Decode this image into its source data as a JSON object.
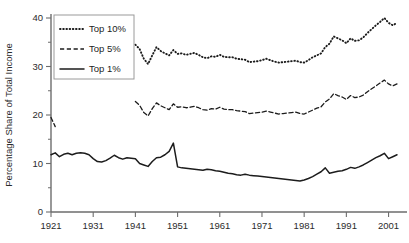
{
  "chart_data": {
    "type": "line",
    "title": "",
    "xlabel": "",
    "ylabel": "Percentage Share of Total Income",
    "xlim": [
      1921,
      2003
    ],
    "ylim": [
      0,
      40
    ],
    "grid": false,
    "legend_position": "top-left",
    "xticks": [
      1921,
      1931,
      1941,
      1951,
      1961,
      1971,
      1981,
      1991,
      2001
    ],
    "xtick_labels": [
      "1921",
      "1931",
      "1941",
      "1951",
      "1961",
      "1971",
      "1981",
      "1991",
      "2001"
    ],
    "yticks": [
      0,
      10,
      20,
      30,
      40
    ],
    "ytick_labels": [
      "0",
      "10",
      "20",
      "30",
      "40"
    ],
    "yticks_minor": [
      5,
      15,
      25,
      35
    ],
    "series": [
      {
        "name": "Top 10%",
        "style": "dotted",
        "color": "#1c1c1c",
        "x": [
          1941,
          1942,
          1943,
          1944,
          1945,
          1946,
          1947,
          1948,
          1949,
          1950,
          1951,
          1952,
          1953,
          1954,
          1955,
          1956,
          1957,
          1958,
          1959,
          1960,
          1961,
          1962,
          1963,
          1964,
          1965,
          1966,
          1967,
          1968,
          1969,
          1970,
          1971,
          1972,
          1973,
          1974,
          1975,
          1976,
          1977,
          1978,
          1979,
          1980,
          1981,
          1982,
          1983,
          1984,
          1985,
          1986,
          1987,
          1988,
          1989,
          1990,
          1991,
          1992,
          1993,
          1994,
          1995,
          1996,
          1997,
          1998,
          1999,
          2000,
          2001,
          2002,
          2003
        ],
        "y": [
          34.5,
          33.6,
          31.6,
          30.5,
          32.3,
          34.0,
          33.2,
          32.7,
          32.3,
          33.4,
          32.6,
          32.7,
          32.4,
          32.6,
          32.8,
          32.4,
          31.9,
          31.7,
          32.1,
          32.0,
          32.4,
          32.0,
          31.9,
          31.9,
          31.6,
          31.5,
          31.4,
          30.9,
          31.0,
          31.1,
          31.3,
          31.6,
          31.3,
          31.0,
          30.8,
          30.9,
          31.0,
          31.1,
          31.2,
          30.9,
          30.8,
          31.3,
          31.9,
          32.3,
          32.7,
          34.0,
          34.7,
          36.2,
          35.8,
          35.4,
          34.8,
          35.8,
          35.3,
          35.4,
          36.0,
          36.9,
          37.7,
          38.5,
          39.2,
          40.0,
          39.0,
          38.5,
          39.0
        ]
      },
      {
        "name": "Top 5%",
        "style": "dashed",
        "color": "#1c1c1c",
        "x": [
          1921,
          1922,
          1941,
          1942,
          1943,
          1944,
          1945,
          1946,
          1947,
          1948,
          1949,
          1950,
          1951,
          1952,
          1953,
          1954,
          1955,
          1956,
          1957,
          1958,
          1959,
          1960,
          1961,
          1962,
          1963,
          1964,
          1965,
          1966,
          1967,
          1968,
          1969,
          1970,
          1971,
          1972,
          1973,
          1974,
          1975,
          1976,
          1977,
          1978,
          1979,
          1980,
          1981,
          1982,
          1983,
          1984,
          1985,
          1986,
          1987,
          1988,
          1989,
          1990,
          1991,
          1992,
          1993,
          1994,
          1995,
          1996,
          1997,
          1998,
          1999,
          2000,
          2001,
          2002,
          2003
        ],
        "y": [
          19.5,
          17.6,
          22.8,
          22.0,
          20.5,
          19.8,
          21.3,
          22.5,
          21.9,
          21.5,
          21.1,
          22.3,
          21.6,
          21.7,
          21.5,
          21.6,
          21.8,
          21.5,
          21.1,
          21.0,
          21.3,
          21.2,
          21.6,
          21.2,
          21.1,
          21.1,
          20.9,
          20.8,
          20.7,
          20.3,
          20.4,
          20.5,
          20.6,
          20.8,
          20.6,
          20.4,
          20.2,
          20.3,
          20.4,
          20.5,
          20.6,
          20.3,
          20.2,
          20.6,
          21.0,
          21.4,
          21.7,
          22.7,
          23.3,
          24.4,
          24.0,
          23.7,
          23.2,
          24.0,
          23.6,
          23.7,
          24.1,
          24.8,
          25.4,
          26.0,
          26.6,
          27.2,
          26.4,
          26.0,
          26.4
        ]
      },
      {
        "name": "Top 1%",
        "style": "solid",
        "color": "#1c1c1c",
        "x": [
          1921,
          1922,
          1923,
          1924,
          1925,
          1926,
          1927,
          1928,
          1929,
          1930,
          1931,
          1932,
          1933,
          1934,
          1935,
          1936,
          1937,
          1938,
          1939,
          1940,
          1941,
          1942,
          1943,
          1944,
          1945,
          1946,
          1947,
          1948,
          1949,
          1950,
          1951,
          1952,
          1953,
          1954,
          1955,
          1956,
          1957,
          1958,
          1959,
          1960,
          1961,
          1962,
          1963,
          1964,
          1965,
          1966,
          1967,
          1968,
          1969,
          1970,
          1971,
          1972,
          1973,
          1974,
          1975,
          1976,
          1977,
          1978,
          1979,
          1980,
          1981,
          1982,
          1983,
          1984,
          1985,
          1986,
          1987,
          1988,
          1989,
          1990,
          1991,
          1992,
          1993,
          1994,
          1995,
          1996,
          1997,
          1998,
          1999,
          2000,
          2001,
          2002,
          2003
        ],
        "y": [
          11.8,
          12.2,
          11.4,
          11.9,
          12.1,
          11.8,
          12.1,
          12.2,
          12.1,
          11.8,
          11.0,
          10.4,
          10.3,
          10.6,
          11.1,
          11.7,
          11.2,
          10.9,
          11.2,
          11.1,
          11.0,
          10.0,
          9.7,
          9.4,
          10.4,
          11.2,
          11.3,
          11.8,
          12.5,
          14.2,
          9.3,
          9.1,
          9.0,
          8.9,
          8.8,
          8.7,
          8.6,
          8.8,
          8.7,
          8.5,
          8.4,
          8.2,
          8.0,
          7.9,
          7.7,
          7.6,
          7.8,
          7.6,
          7.5,
          7.4,
          7.3,
          7.2,
          7.1,
          7.0,
          6.9,
          6.8,
          6.7,
          6.6,
          6.5,
          6.4,
          6.6,
          6.9,
          7.3,
          7.8,
          8.3,
          9.1,
          8.0,
          8.2,
          8.4,
          8.5,
          8.8,
          9.2,
          9.0,
          9.3,
          9.7,
          10.2,
          10.7,
          11.2,
          11.6,
          12.1,
          11.0,
          11.4,
          11.8
        ]
      }
    ]
  },
  "legend": {
    "entries": [
      {
        "label": "Top 10%",
        "style": "dotted"
      },
      {
        "label": "Top 5%",
        "style": "dashed"
      },
      {
        "label": "Top 1%",
        "style": "solid"
      }
    ]
  },
  "axes": {
    "y_title": "Percentage Share of Total Income"
  }
}
